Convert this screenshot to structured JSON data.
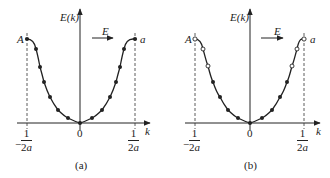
{
  "figure": {
    "panels": [
      {
        "id": "a",
        "caption": "(a)",
        "y_axis_label": "E(k)",
        "x_axis_label": "k",
        "origin_label": "0",
        "left_point_label": "A",
        "right_point_label": "a",
        "field_label": "E",
        "left_tick": {
          "sign": "−",
          "num": "1",
          "den_coef": "2",
          "den_var": "a"
        },
        "right_tick": {
          "num": "1",
          "den_coef": "2",
          "den_var": "a"
        },
        "states": "all filled"
      },
      {
        "id": "b",
        "caption": "(b)",
        "y_axis_label": "E(k)",
        "x_axis_label": "k",
        "origin_label": "0",
        "left_point_label": "A",
        "right_point_label": "a",
        "field_label": "E",
        "left_tick": {
          "sign": "−",
          "num": "1",
          "den_coef": "2",
          "den_var": "a"
        },
        "right_tick": {
          "num": "1",
          "den_coef": "2",
          "den_var": "a"
        },
        "states": "top states empty (open circles), lower states filled"
      }
    ],
    "colors": {
      "ink": "#222222",
      "background": "#ffffff"
    }
  }
}
